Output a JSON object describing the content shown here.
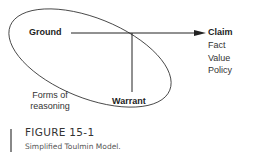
{
  "diagram": {
    "ground": "Ground",
    "warrant": "Warrant",
    "claim": "Claim",
    "claim_types": [
      "Fact",
      "Value",
      "Policy"
    ],
    "forms_of_reasoning": [
      "Forms of",
      "reasoning"
    ]
  },
  "caption": {
    "title": "FIGURE 15-1",
    "subtitle": "Simplified Toulmin Model."
  }
}
